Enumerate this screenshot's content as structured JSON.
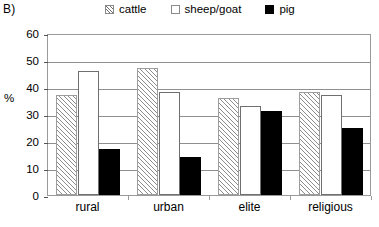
{
  "panel": {
    "label": "B)"
  },
  "legend": {
    "position": "top",
    "items": [
      {
        "key": "cattle",
        "label": "cattle",
        "swatch": "hatched-square-icon"
      },
      {
        "key": "sheep_goat",
        "label": "sheep/goat",
        "swatch": "white-square-icon"
      },
      {
        "key": "pig",
        "label": "pig",
        "swatch": "black-square-icon"
      }
    ]
  },
  "axes": {
    "y_title": "%",
    "y_ticks": [
      "0",
      "10",
      "20",
      "30",
      "40",
      "50",
      "60"
    ],
    "x_categories": [
      "rural",
      "urban",
      "elite",
      "religious"
    ]
  },
  "chart_data": {
    "type": "bar",
    "title": "B)",
    "xlabel": "",
    "ylabel": "%",
    "ylim": [
      0,
      60
    ],
    "ytick_step": 10,
    "grid": true,
    "legend_position": "top",
    "categories": [
      "rural",
      "urban",
      "elite",
      "religious"
    ],
    "series": [
      {
        "name": "cattle",
        "values": [
          37,
          47,
          36,
          38
        ]
      },
      {
        "name": "sheep/goat",
        "values": [
          46,
          38,
          33,
          37
        ]
      },
      {
        "name": "pig",
        "values": [
          17,
          14,
          31,
          25
        ]
      }
    ]
  }
}
